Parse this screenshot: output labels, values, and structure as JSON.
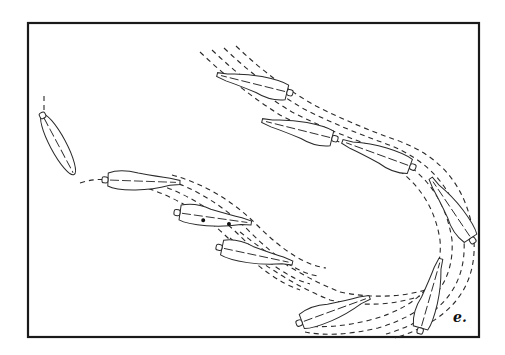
{
  "figure": {
    "panel_label": "e.",
    "colors": {
      "ink": "#2a2a2a",
      "background": "#ffffff"
    },
    "frame": {
      "x": 28,
      "y": 23,
      "width": 451,
      "height": 314
    }
  }
}
